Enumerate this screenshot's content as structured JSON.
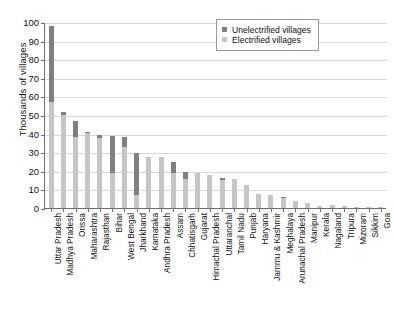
{
  "chart_data": {
    "type": "bar",
    "subtype": "stacked-vertical",
    "title": "",
    "xlabel": "",
    "ylabel": "Thousands of villages",
    "ylim": [
      0,
      100
    ],
    "yticks": [
      0,
      10,
      20,
      30,
      40,
      50,
      60,
      70,
      80,
      90,
      100
    ],
    "grid": true,
    "legend_position": "top-right",
    "categories": [
      "Uttar Pradesh",
      "Madhya Pradesh",
      "Orissa",
      "Maharashtra",
      "Rajasthan",
      "Bihar",
      "West Bengal",
      "Jharkhand",
      "Karnataka",
      "Andhra Pradesh",
      "Assam",
      "Chhatisgarh",
      "Gujarat",
      "Himachal Pradesh",
      "Uttaranchal",
      "Tamil Nadu",
      "Punjab",
      "Haryana",
      "Jammu & Kashmir",
      "Meghalaya",
      "Arunachal Pradesh",
      "Manipur",
      "Kerala",
      "Nagaland",
      "Tripura",
      "Mizoram",
      "Sikkim",
      "Goa"
    ],
    "series": [
      {
        "name": "Electrified villages",
        "color": "#c6c6c6",
        "values": [
          57,
          50,
          38,
          40.5,
          37.5,
          19,
          33,
          7,
          27.5,
          27.3,
          19,
          15.5,
          19,
          17.5,
          15,
          15.5,
          12.3,
          7.3,
          6.8,
          5.2,
          4,
          2.5,
          1,
          1.4,
          1.1,
          0.8,
          0.5,
          0.4
        ]
      },
      {
        "name": "Unelectrified villages",
        "color": "#808080",
        "values": [
          41,
          1.5,
          9,
          0.5,
          2,
          19.5,
          5,
          22.5,
          0,
          0,
          6,
          4,
          0,
          0,
          1,
          0,
          0,
          0,
          0,
          0.4,
          0,
          0,
          0,
          0,
          0,
          0,
          0,
          0
        ]
      }
    ],
    "totals": [
      98,
      51.5,
      47,
      41,
      39.5,
      38.5,
      38,
      29.5,
      27.5,
      27.3,
      25,
      19.5,
      19,
      17.5,
      16,
      15.5,
      12.3,
      7.3,
      6.8,
      5.6,
      4,
      2.5,
      1,
      1.4,
      1.1,
      0.8,
      0.5,
      0.4
    ]
  },
  "legend": {
    "items": [
      {
        "label": "Unelectrified villages",
        "color": "#808080"
      },
      {
        "label": "Electrified villages",
        "color": "#c6c6c6"
      }
    ]
  },
  "axes": {
    "y_title": "Thousands of villages"
  }
}
